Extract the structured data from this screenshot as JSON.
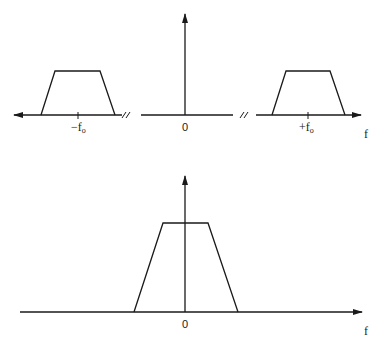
{
  "top_plot": {
    "labels": {
      "neg_f0": "−f",
      "neg_f0_sub": "o",
      "zero": "0",
      "pos_f0": "+f",
      "pos_f0_sub": "o",
      "axis": "f"
    },
    "break_mark": "//"
  },
  "bottom_plot": {
    "labels": {
      "zero": "0",
      "axis": "f"
    }
  },
  "colors": {
    "stroke": "#1a1a1a",
    "background": "#ffffff"
  }
}
